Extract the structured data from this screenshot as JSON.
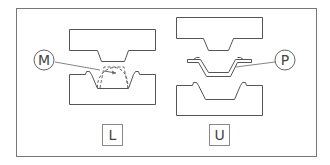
{
  "diagram": {
    "title": "",
    "colors": {
      "stroke": "#555555",
      "frame": "#777777",
      "background": "#ffffff"
    },
    "panels": [
      {
        "id": "left",
        "label": "L",
        "callout": "M",
        "description": "Upper and lower die with dashed arc showing material (M) being formed"
      },
      {
        "id": "right",
        "label": "U",
        "callout": "P",
        "description": "Upper die, formed part (P) with flanges, and lower die separated"
      }
    ]
  }
}
